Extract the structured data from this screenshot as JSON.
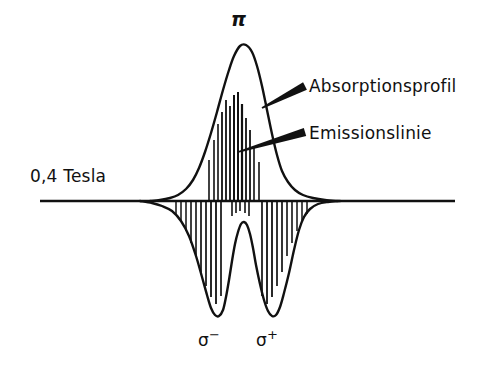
{
  "figure": {
    "title_implied": "Zeeman-Aufspaltung: Absorptionsprofil und Emissionslinien",
    "background_color": "#ffffff",
    "ink_color": "#111111",
    "width": 490,
    "height": 375
  },
  "labels": {
    "field_strength": "0,4 Tesla",
    "absorption_profile": "Absorptionsprofil",
    "emission_line": "Emissionslinie",
    "pi_component": "π",
    "sigma_minus_base": "σ",
    "sigma_minus_sign": "−",
    "sigma_plus_base": "σ",
    "sigma_plus_sign": "+"
  },
  "chart_data": {
    "type": "line",
    "title": "",
    "xlabel": "",
    "ylabel": "",
    "grid": false,
    "legend_position": "right-callout",
    "baseline_y": 201,
    "axis": {
      "x_start": 40,
      "x_end": 455,
      "y": 201,
      "stroke_width": 2.6
    },
    "annotations": [
      {
        "name": "field_strength",
        "text": "0,4 Tesla",
        "x": 30,
        "y": 180
      },
      {
        "name": "pi_peak_label",
        "text": "π",
        "x": 237,
        "y": 20
      },
      {
        "name": "sigma_minus_label",
        "text": "σ−",
        "x": 210,
        "y": 342
      },
      {
        "name": "sigma_plus_label",
        "text": "σ+",
        "x": 268,
        "y": 342
      }
    ],
    "callouts": [
      {
        "name": "absorption_profile",
        "label": "Absorptionsprofil",
        "tip_x": 262,
        "tip_y": 108,
        "tail_x": 305,
        "tail_y": 86,
        "text_x": 309,
        "text_y": 90
      },
      {
        "name": "emission_line",
        "label": "Emissionslinie",
        "tip_x": 238,
        "tip_y": 152,
        "tail_x": 305,
        "tail_y": 132,
        "text_x": 309,
        "text_y": 137
      }
    ],
    "series": [
      {
        "name": "absorption_profile_upper",
        "description": "Broad pi absorption peak above baseline",
        "orientation": "up",
        "peak_x": 240,
        "peak_y": 45,
        "amplitude": 156,
        "half_width": 34,
        "points": [
          [
            150,
            201
          ],
          [
            160,
            200
          ],
          [
            170,
            198
          ],
          [
            178,
            195
          ],
          [
            186,
            189
          ],
          [
            193,
            180
          ],
          [
            199,
            168
          ],
          [
            205,
            152
          ],
          [
            211,
            133
          ],
          [
            217,
            112
          ],
          [
            223,
            90
          ],
          [
            229,
            70
          ],
          [
            234,
            56
          ],
          [
            240,
            46
          ],
          [
            246,
            45
          ],
          [
            252,
            52
          ],
          [
            257,
            66
          ],
          [
            262,
            86
          ],
          [
            267,
            110
          ],
          [
            272,
            134
          ],
          [
            277,
            155
          ],
          [
            282,
            171
          ],
          [
            288,
            182
          ],
          [
            295,
            190
          ],
          [
            303,
            195
          ],
          [
            313,
            198
          ],
          [
            325,
            200
          ],
          [
            338,
            201
          ]
        ]
      },
      {
        "name": "dispersion_lower",
        "description": "Two downward sigma lobes with a central rise between them",
        "orientation": "down",
        "points": [
          [
            140,
            201
          ],
          [
            152,
            203
          ],
          [
            162,
            206
          ],
          [
            172,
            211
          ],
          [
            181,
            221
          ],
          [
            189,
            236
          ],
          [
            196,
            256
          ],
          [
            202,
            277
          ],
          [
            207,
            295
          ],
          [
            211,
            308
          ],
          [
            215,
            315
          ],
          [
            219,
            316
          ],
          [
            223,
            310
          ],
          [
            226,
            297
          ],
          [
            229,
            280
          ],
          [
            232,
            261
          ],
          [
            235,
            244
          ],
          [
            238,
            232
          ],
          [
            241,
            224
          ],
          [
            244,
            222
          ],
          [
            247,
            225
          ],
          [
            250,
            234
          ],
          [
            253,
            248
          ],
          [
            256,
            265
          ],
          [
            260,
            284
          ],
          [
            264,
            300
          ],
          [
            268,
            311
          ],
          [
            272,
            316
          ],
          [
            276,
            315
          ],
          [
            280,
            307
          ],
          [
            284,
            293
          ],
          [
            289,
            273
          ],
          [
            294,
            250
          ],
          [
            299,
            230
          ],
          [
            304,
            217
          ],
          [
            310,
            209
          ],
          [
            318,
            204
          ],
          [
            328,
            202
          ],
          [
            340,
            201
          ]
        ]
      }
    ],
    "emission_lines_upper": {
      "description": "Vertical emission sticks rising from baseline inside the pi absorption peak",
      "baseline_y": 201,
      "lines": [
        {
          "x": 209,
          "top_y": 160,
          "width": 1.6
        },
        {
          "x": 214,
          "top_y": 140,
          "width": 1.6
        },
        {
          "x": 218,
          "top_y": 124,
          "width": 1.6
        },
        {
          "x": 222,
          "top_y": 112,
          "width": 1.8
        },
        {
          "x": 226,
          "top_y": 100,
          "width": 1.8
        },
        {
          "x": 230,
          "top_y": 106,
          "width": 1.8
        },
        {
          "x": 234,
          "top_y": 95,
          "width": 2.0
        },
        {
          "x": 238,
          "top_y": 92,
          "width": 2.0
        },
        {
          "x": 242,
          "top_y": 104,
          "width": 2.2
        },
        {
          "x": 246,
          "top_y": 118,
          "width": 1.8
        },
        {
          "x": 250,
          "top_y": 130,
          "width": 1.8
        },
        {
          "x": 254,
          "top_y": 146,
          "width": 1.6
        },
        {
          "x": 259,
          "top_y": 162,
          "width": 1.6
        }
      ]
    },
    "emission_lines_lower": {
      "description": "Vertical emission sticks descending from baseline across the two sigma lobes",
      "baseline_y": 201,
      "left_group": [
        {
          "x": 176,
          "bottom_y": 214,
          "width": 1.5
        },
        {
          "x": 181,
          "bottom_y": 221,
          "width": 1.5
        },
        {
          "x": 186,
          "bottom_y": 231,
          "width": 1.5
        },
        {
          "x": 191,
          "bottom_y": 243,
          "width": 1.6
        },
        {
          "x": 196,
          "bottom_y": 256,
          "width": 1.6
        },
        {
          "x": 201,
          "bottom_y": 272,
          "width": 1.7
        },
        {
          "x": 206,
          "bottom_y": 286,
          "width": 1.7
        },
        {
          "x": 211,
          "bottom_y": 297,
          "width": 1.8
        },
        {
          "x": 216,
          "bottom_y": 304,
          "width": 1.8
        },
        {
          "x": 221,
          "bottom_y": 296,
          "width": 1.7
        }
      ],
      "right_group": [
        {
          "x": 262,
          "bottom_y": 296,
          "width": 1.7
        },
        {
          "x": 267,
          "bottom_y": 304,
          "width": 1.8
        },
        {
          "x": 272,
          "bottom_y": 297,
          "width": 1.8
        },
        {
          "x": 277,
          "bottom_y": 286,
          "width": 1.7
        },
        {
          "x": 282,
          "bottom_y": 272,
          "width": 1.7
        },
        {
          "x": 287,
          "bottom_y": 256,
          "width": 1.6
        },
        {
          "x": 292,
          "bottom_y": 243,
          "width": 1.6
        },
        {
          "x": 297,
          "bottom_y": 231,
          "width": 1.5
        },
        {
          "x": 302,
          "bottom_y": 221,
          "width": 1.5
        },
        {
          "x": 307,
          "bottom_y": 214,
          "width": 1.5
        }
      ],
      "center_group": [
        {
          "x": 232,
          "bottom_y": 216,
          "width": 1.6
        },
        {
          "x": 236,
          "bottom_y": 213,
          "width": 1.6
        },
        {
          "x": 240,
          "bottom_y": 211,
          "width": 1.6
        },
        {
          "x": 245,
          "bottom_y": 213,
          "width": 1.6
        },
        {
          "x": 249,
          "bottom_y": 216,
          "width": 1.6
        }
      ]
    }
  }
}
